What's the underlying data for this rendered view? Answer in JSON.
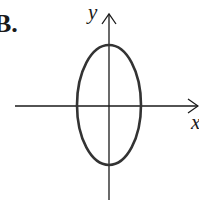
{
  "figure": {
    "choice_label": "B.",
    "x_axis_label": "x",
    "y_axis_label": "y",
    "shape": "ellipse",
    "colors": {
      "stroke": "#1a1a1a",
      "ellipse_stroke": "#333333",
      "background": "#ffffff"
    }
  }
}
